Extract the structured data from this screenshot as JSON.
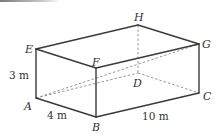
{
  "figure": {
    "type": "cuboid",
    "vertices": {
      "A": {
        "label": "A",
        "x": 36,
        "y": 98
      },
      "B": {
        "label": "B",
        "x": 96,
        "y": 117
      },
      "C": {
        "label": "C",
        "x": 199,
        "y": 93
      },
      "D": {
        "label": "D",
        "x": 138,
        "y": 73
      },
      "E": {
        "label": "E",
        "x": 36,
        "y": 49
      },
      "F": {
        "label": "F",
        "x": 96,
        "y": 68
      },
      "G": {
        "label": "G",
        "x": 199,
        "y": 44
      },
      "H": {
        "label": "H",
        "x": 138,
        "y": 25
      }
    },
    "visible_edges": [
      [
        "A",
        "B"
      ],
      [
        "B",
        "C"
      ],
      [
        "A",
        "E"
      ],
      [
        "B",
        "F"
      ],
      [
        "C",
        "G"
      ],
      [
        "E",
        "F"
      ],
      [
        "F",
        "G"
      ],
      [
        "E",
        "H"
      ],
      [
        "H",
        "G"
      ]
    ],
    "hidden_edges": [
      [
        "H",
        "D"
      ],
      [
        "A",
        "D"
      ],
      [
        "D",
        "C"
      ],
      [
        "A",
        "G"
      ]
    ],
    "dimensions": {
      "height": "3 m",
      "width": "4 m",
      "length": "10 m"
    }
  }
}
